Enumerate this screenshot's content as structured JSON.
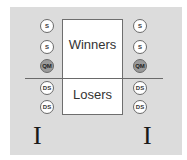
{
  "diagram": {
    "box": {
      "top_label": "Winners",
      "bottom_label": "Losers"
    },
    "left_column": [
      {
        "label": "S",
        "type": "s"
      },
      {
        "label": "S",
        "type": "s"
      },
      {
        "label": "QM",
        "type": "qm"
      },
      {
        "label": "DS",
        "type": "ds"
      },
      {
        "label": "DS",
        "type": "ds"
      }
    ],
    "right_column": [
      {
        "label": "S",
        "type": "s"
      },
      {
        "label": "S",
        "type": "s"
      },
      {
        "label": "QM",
        "type": "qm"
      },
      {
        "label": "DS",
        "type": "ds"
      },
      {
        "label": "DS",
        "type": "ds"
      }
    ],
    "left_marker": "I",
    "right_marker": "I",
    "colors": {
      "panel": "#dcdcdc",
      "box": "#ffffff",
      "qm_fill": "#9a9a9a",
      "circle_fill": "#ffffff"
    }
  }
}
